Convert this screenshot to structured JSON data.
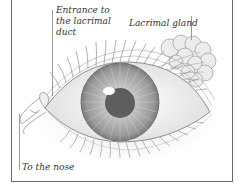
{
  "figure": {
    "labels": {
      "entrance_line1": "Entrance to",
      "entrance_line2": "the lacrimal",
      "entrance_line3": "duct",
      "lacrimal_gland": "Lacrimal gland",
      "to_nose": "To the nose"
    },
    "colors": {
      "frame": "#6a6a6a",
      "iris": "#9c9c9c",
      "pupil": "#5e5e5e",
      "sclera": "#f4f4f4",
      "linework": "#8a8a8a"
    }
  }
}
